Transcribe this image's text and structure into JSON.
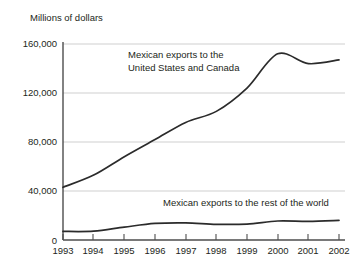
{
  "chart_data": {
    "type": "line",
    "title": "",
    "ylabel": "Millions of dollars",
    "xlabel": "",
    "ylim": [
      0,
      160000
    ],
    "yticks": [
      0,
      40000,
      80000,
      120000,
      160000
    ],
    "ytick_labels": [
      "0",
      "40,000",
      "80,000",
      "120,000",
      "160,000"
    ],
    "grid": true,
    "legend_position": "inline-annotation",
    "x": [
      "1993",
      "1994",
      "1995",
      "1996",
      "1997",
      "1998",
      "1999",
      "2000",
      "2001",
      "2002"
    ],
    "categories": [
      "1993",
      "1994",
      "1995",
      "1996",
      "1997",
      "1998",
      "1999",
      "2000",
      "2001",
      "2002"
    ],
    "series": [
      {
        "name": "Mexican exports to the United States and Canada",
        "annotation_lines": [
          "Mexican exports to the",
          "United States and Canada"
        ],
        "color": "#2b2b2b",
        "values": [
          43000,
          53000,
          68000,
          82000,
          96000,
          105000,
          124000,
          152000,
          144000,
          147000
        ]
      },
      {
        "name": "Mexican exports to the rest of the world",
        "annotation_lines": [
          "Mexican exports to the rest of the world"
        ],
        "color": "#2b2b2b",
        "values": [
          7000,
          7200,
          10500,
          13500,
          14000,
          12800,
          13000,
          15500,
          15200,
          16000
        ]
      }
    ]
  },
  "axis": {
    "y_title": "Millions of dollars",
    "ytick_0": "0",
    "ytick_1": "40,000",
    "ytick_2": "80,000",
    "ytick_3": "120,000",
    "ytick_4": "160,000",
    "xtick_0": "1993",
    "xtick_1": "1994",
    "xtick_2": "1995",
    "xtick_3": "1996",
    "xtick_4": "1997",
    "xtick_5": "1998",
    "xtick_6": "1999",
    "xtick_7": "2000",
    "xtick_8": "2001",
    "xtick_9": "2002"
  },
  "annotations": {
    "upper_line_1": "Mexican exports to the",
    "upper_line_2": "United States and Canada",
    "lower_line_1": "Mexican exports to the rest of the world"
  },
  "colors": {
    "line": "#2b2b2b",
    "grid": "#c9c9c9",
    "axis": "#4d4d4d",
    "text": "#231f20",
    "background": "#ffffff"
  }
}
